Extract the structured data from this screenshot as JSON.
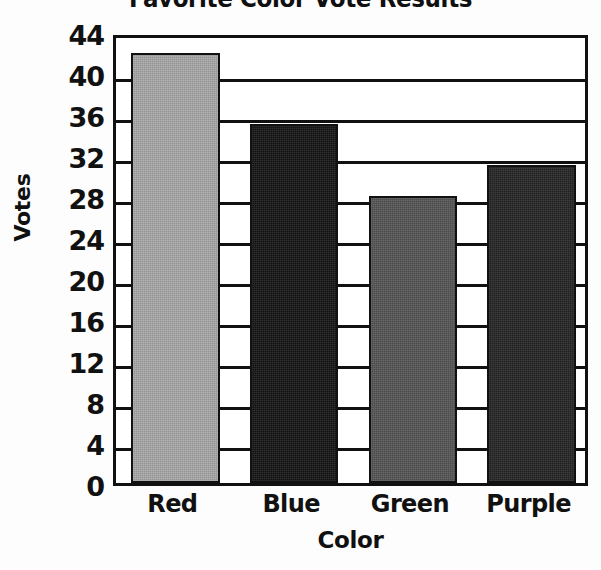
{
  "chart_data": {
    "type": "bar",
    "title": "Favorite Color Vote Results",
    "xlabel": "Color",
    "ylabel": "Votes",
    "categories": [
      "Red",
      "Blue",
      "Green",
      "Purple"
    ],
    "values": [
      42,
      35,
      28,
      31
    ],
    "ylim": [
      0,
      44
    ],
    "ytick_step": 4,
    "yticks": [
      44,
      40,
      36,
      32,
      28,
      24,
      20,
      16,
      12,
      8,
      4,
      0
    ],
    "grid": "horizontal",
    "legend": "none",
    "bar_colors": [
      "#a8a8a8",
      "#151515",
      "#555555",
      "#252525"
    ],
    "frame_color": "#111111",
    "background": "#ffffff"
  }
}
